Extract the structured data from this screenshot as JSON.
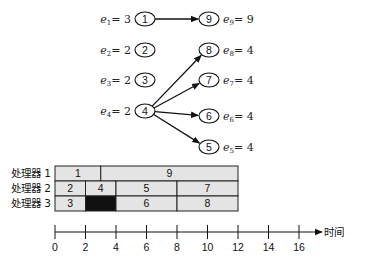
{
  "diagram": {
    "nodes": [
      {
        "id": "1",
        "label": "1",
        "side": "left",
        "weight_var": "e",
        "weight_sub": "1",
        "weight": "3"
      },
      {
        "id": "2",
        "label": "2",
        "side": "left",
        "weight_var": "e",
        "weight_sub": "2",
        "weight": "2"
      },
      {
        "id": "3",
        "label": "3",
        "side": "left",
        "weight_var": "e",
        "weight_sub": "3",
        "weight": "2"
      },
      {
        "id": "4",
        "label": "4",
        "side": "left",
        "weight_var": "e",
        "weight_sub": "4",
        "weight": "2"
      },
      {
        "id": "9",
        "label": "9",
        "side": "right",
        "weight_var": "e",
        "weight_sub": "9",
        "weight": "9"
      },
      {
        "id": "8",
        "label": "8",
        "side": "right",
        "weight_var": "e",
        "weight_sub": "8",
        "weight": "4"
      },
      {
        "id": "7",
        "label": "7",
        "side": "right",
        "weight_var": "e",
        "weight_sub": "7",
        "weight": "4"
      },
      {
        "id": "6",
        "label": "6",
        "side": "right",
        "weight_var": "e",
        "weight_sub": "6",
        "weight": "4"
      },
      {
        "id": "5",
        "label": "5",
        "side": "right",
        "weight_var": "e",
        "weight_sub": "5",
        "weight": "4"
      }
    ],
    "edges": [
      {
        "from": "1",
        "to": "9"
      },
      {
        "from": "4",
        "to": "8"
      },
      {
        "from": "4",
        "to": "7"
      },
      {
        "from": "4",
        "to": "6"
      },
      {
        "from": "4",
        "to": "5"
      }
    ]
  },
  "gantt": {
    "processors": [
      {
        "label": "处理器 1",
        "tasks": [
          {
            "label": "1",
            "start": 0,
            "end": 3,
            "idle": false
          },
          {
            "label": "9",
            "start": 3,
            "end": 12,
            "idle": false
          }
        ]
      },
      {
        "label": "处理器 2",
        "tasks": [
          {
            "label": "2",
            "start": 0,
            "end": 2,
            "idle": false
          },
          {
            "label": "4",
            "start": 2,
            "end": 4,
            "idle": false
          },
          {
            "label": "5",
            "start": 4,
            "end": 8,
            "idle": false
          },
          {
            "label": "7",
            "start": 8,
            "end": 12,
            "idle": false
          }
        ]
      },
      {
        "label": "处理器 3",
        "tasks": [
          {
            "label": "3",
            "start": 0,
            "end": 2,
            "idle": false
          },
          {
            "label": "",
            "start": 2,
            "end": 4,
            "idle": true
          },
          {
            "label": "6",
            "start": 4,
            "end": 8,
            "idle": false
          },
          {
            "label": "8",
            "start": 8,
            "end": 12,
            "idle": false
          }
        ]
      }
    ],
    "axis": {
      "title": "时间",
      "ticks": [
        0,
        2,
        4,
        6,
        8,
        10,
        12,
        14,
        16
      ],
      "range": [
        0,
        17.5
      ]
    },
    "colors": {
      "task_fill": "#e4e4e4",
      "idle_fill": "#111111",
      "border": "#222222"
    }
  }
}
